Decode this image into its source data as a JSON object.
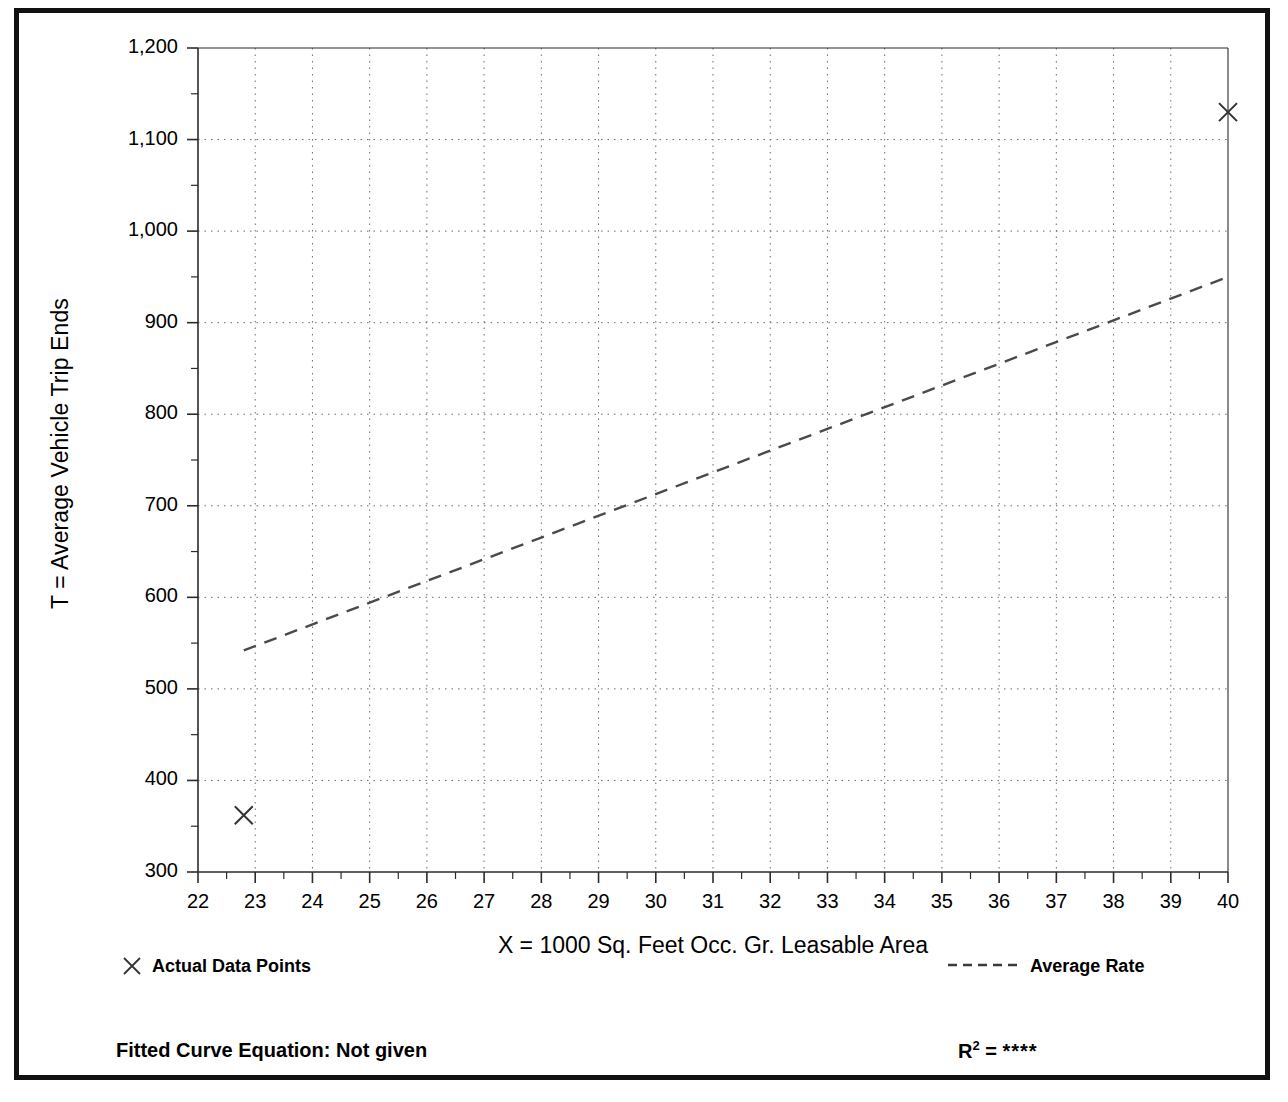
{
  "chart_data": {
    "type": "scatter",
    "title": "",
    "xlabel": "X = 1000 Sq. Feet Occ. Gr. Leasable Area",
    "ylabel": "T = Average Vehicle Trip Ends",
    "xlim": [
      22,
      40
    ],
    "ylim": [
      300,
      1200
    ],
    "x_tick_step": 1,
    "y_tick_step": 100,
    "x_minor_step": 0.5,
    "y_minor_step": 50,
    "grid": true,
    "grid_style": "dotted",
    "x_ticks": [
      22,
      23,
      24,
      25,
      26,
      27,
      28,
      29,
      30,
      31,
      32,
      33,
      34,
      35,
      36,
      37,
      38,
      39,
      40
    ],
    "x_tick_labels": [
      "22",
      "23",
      "24",
      "25",
      "26",
      "27",
      "28",
      "29",
      "30",
      "31",
      "32",
      "33",
      "34",
      "35",
      "36",
      "37",
      "38",
      "39",
      "40"
    ],
    "y_ticks": [
      300,
      400,
      500,
      600,
      700,
      800,
      900,
      1000,
      1100,
      1200
    ],
    "y_tick_labels": [
      "300",
      "400",
      "500",
      "600",
      "700",
      "800",
      "900",
      "1,000",
      "1,100",
      "1,200"
    ],
    "series": [
      {
        "name": "Actual Data Points",
        "type": "scatter",
        "marker": "x",
        "color": "#333333",
        "points": [
          {
            "x": 22.8,
            "y": 362
          },
          {
            "x": 40.0,
            "y": 1130
          }
        ]
      },
      {
        "name": "Average Rate",
        "type": "line",
        "style": "dashed",
        "color": "#4a4a4a",
        "points": [
          {
            "x": 22.8,
            "y": 542
          },
          {
            "x": 40.0,
            "y": 950
          }
        ]
      }
    ]
  },
  "legend": {
    "position": "below-axis",
    "actual_points_label": "Actual Data Points",
    "average_rate_label": "Average Rate"
  },
  "footer": {
    "equation_label": "Fitted Curve Equation:  Not given",
    "r2_symbol": "R",
    "r2_exponent": "2",
    "r2_equals": " = ",
    "r2_value": "****"
  },
  "colors": {
    "frame": "#111111",
    "axis": "#2b2b2b",
    "grid": "#6b6b6b",
    "data": "#333333",
    "trend": "#4a4a4a",
    "background": "#ffffff"
  }
}
